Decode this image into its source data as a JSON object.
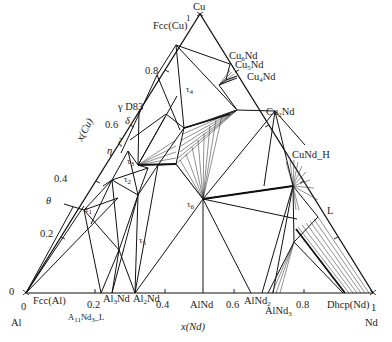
{
  "diagram": {
    "corners": {
      "top": "Cu",
      "left": "Al",
      "right": "Nd"
    },
    "axes": {
      "bottom_title": "x(Nd)",
      "left_title": "x(Cu)",
      "bottom_ticks": [
        "0",
        "0.2",
        "0.4",
        "0.6",
        "0.8",
        "1"
      ],
      "left_ticks": [
        "0",
        "0.2",
        "0.4",
        "0.6",
        "0.8",
        "1"
      ]
    },
    "phases": {
      "fcc_cu": "Fcc(Cu)",
      "cu6nd": "Cu6Nd",
      "cu5nd": "Cu5Nd",
      "cu4nd": "Cu4Nd",
      "cu2nd": "Cu2Nd",
      "cund_h": "CuNd_H",
      "liquid": "L",
      "dhcp_nd": "Dhcp(Nd)",
      "alnd3": "AlNd3",
      "alnd2": "AlNd2",
      "alnd": "AlNd",
      "al2nd": "Al2Nd",
      "al3nd": "Al3Nd",
      "al11nd3_l": "A11Nd3_L",
      "fcc_al": "Fcc(Al)",
      "gamma_d83": "γ D83",
      "delta": "δ",
      "zeta": "ζ",
      "eta": "η",
      "theta": "θ",
      "tau1": "τ1",
      "tau2": "τ2",
      "tau3": "τ3",
      "tau4": "τ4",
      "tau5": "τ5",
      "tau6": "τ6"
    },
    "frame": {
      "al": [
        26,
        293
      ],
      "nd": [
        373,
        293
      ],
      "cu": [
        200,
        14
      ]
    },
    "line_color": "#111111",
    "tie_color": "#222222"
  }
}
